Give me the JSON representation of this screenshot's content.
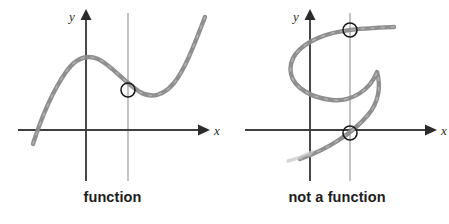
{
  "figure": {
    "background_color": "#ffffff",
    "width": 449,
    "height": 224
  },
  "style": {
    "curve_color": "#8a8a8a",
    "curve_color_light": "#a9a9a9",
    "axis_color": "#3f3f3f",
    "test_line_color": "#b5b5b5",
    "marker_stroke_color": "#1a1a1a",
    "caption_color": "#1d1d1d"
  },
  "panels": [
    {
      "id": "function",
      "caption": "function",
      "axes": {
        "x_label": "x",
        "y_label": "y",
        "origin": {
          "x": 86,
          "y": 130
        }
      },
      "vertical_test_line": {
        "label": "vertical line",
        "x": 128,
        "y_top": 13,
        "y_bottom": 181
      },
      "intersections": [
        {
          "x": 128,
          "y": 90,
          "radius": 7
        }
      ],
      "intersection_count": 1,
      "curve": {
        "type": "cubic",
        "description": "rises from lower left to a local maximum, dips to a local minimum, then rises steeply",
        "points": [
          [
            33,
            144
          ],
          [
            38,
            130
          ],
          [
            44,
            113
          ],
          [
            51,
            96
          ],
          [
            58,
            82
          ],
          [
            66,
            71
          ],
          [
            74,
            63
          ],
          [
            82,
            58
          ],
          [
            90,
            57
          ],
          [
            98,
            59
          ],
          [
            106,
            64
          ],
          [
            114,
            71
          ],
          [
            122,
            79
          ],
          [
            130,
            86
          ],
          [
            138,
            92
          ],
          [
            146,
            95
          ],
          [
            154,
            96
          ],
          [
            162,
            94
          ],
          [
            170,
            88
          ],
          [
            178,
            78
          ],
          [
            186,
            64
          ],
          [
            194,
            45
          ],
          [
            201,
            27
          ],
          [
            205,
            17
          ]
        ]
      }
    },
    {
      "id": "not-function",
      "caption": "not a function",
      "axes": {
        "x_label": "x",
        "y_label": "y",
        "origin": {
          "x": 310,
          "y": 130
        }
      },
      "vertical_test_line": {
        "label": "vertical line",
        "x": 350,
        "y_top": 13,
        "y_bottom": 181
      },
      "intersections": [
        {
          "x": 350,
          "y": 30,
          "radius": 7
        },
        {
          "x": 350,
          "y": 133,
          "radius": 7
        }
      ],
      "intersection_count": 2,
      "curve": {
        "type": "sideways-s",
        "description": "sideways S curve that the vertical line crosses twice",
        "points": [
          [
            394,
            27
          ],
          [
            382,
            28
          ],
          [
            370,
            29
          ],
          [
            358,
            30
          ],
          [
            346,
            30
          ],
          [
            334,
            32
          ],
          [
            322,
            36
          ],
          [
            311,
            41
          ],
          [
            301,
            48
          ],
          [
            294,
            57
          ],
          [
            290,
            67
          ],
          [
            291,
            77
          ],
          [
            296,
            85
          ],
          [
            304,
            91
          ],
          [
            314,
            96
          ],
          [
            326,
            100
          ],
          [
            338,
            100
          ],
          [
            350,
            96
          ],
          [
            362,
            89
          ],
          [
            371,
            79
          ],
          [
            377,
            68
          ],
          [
            378,
            96
          ],
          [
            374,
            107
          ],
          [
            366,
            117
          ],
          [
            356,
            126
          ],
          [
            346,
            134
          ],
          [
            334,
            142
          ],
          [
            322,
            149
          ],
          [
            310,
            155
          ],
          [
            300,
            159
          ]
        ]
      }
    }
  ]
}
